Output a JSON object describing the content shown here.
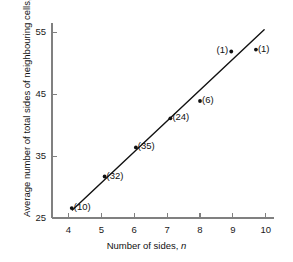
{
  "chart_data": {
    "type": "scatter",
    "title": "",
    "xlabel": "Number of sides, n",
    "xlabel_text": "Number of sides, ",
    "xlabel_symbol": "n",
    "ylabel": "Average number of total sides of neighbouring cells, mm_n",
    "ylabel_text": "Average number of total sides of neighbouring cells, ",
    "ylabel_symbol": "mm",
    "ylabel_symbol_sub": "n",
    "xlim": [
      3.5,
      10.25
    ],
    "ylim": [
      25,
      56.5
    ],
    "xticks": [
      4,
      5,
      6,
      7,
      8,
      9,
      10
    ],
    "xtick_labels": [
      "4",
      "5",
      "6",
      "7",
      "8",
      "9",
      "10"
    ],
    "yticks": [
      25,
      35,
      45,
      55
    ],
    "ytick_labels": [
      "25",
      "35",
      "45",
      "55"
    ],
    "grid": false,
    "legend": false,
    "series": [
      {
        "name": "Measured cells",
        "marker": "dot",
        "points": [
          {
            "x": 4.1,
            "y": 26.6,
            "label": "(10)",
            "label_side": "right"
          },
          {
            "x": 5.1,
            "y": 31.7,
            "label": "(32)",
            "label_side": "right"
          },
          {
            "x": 6.05,
            "y": 36.4,
            "label": "(35)",
            "label_side": "right"
          },
          {
            "x": 7.1,
            "y": 41.1,
            "label": "(24)",
            "label_side": "right"
          },
          {
            "x": 8.0,
            "y": 43.9,
            "label": "(6)",
            "label_side": "right"
          },
          {
            "x": 8.95,
            "y": 51.9,
            "label": "(1)",
            "label_side": "left"
          },
          {
            "x": 9.7,
            "y": 52.2,
            "label": "(1)",
            "label_side": "right"
          }
        ]
      }
    ],
    "fit_line": {
      "name": "Linear fit",
      "x_start": 4.12,
      "y_start": 26.3,
      "x_end": 9.95,
      "y_end": 55.4
    },
    "annotations": [
      "Numbers in parentheses indicate the count of cells measured"
    ]
  },
  "colors": {
    "axis": "#808080",
    "line": "#111111",
    "marker": "#111111",
    "text": "#111111",
    "background": "#ffffff"
  }
}
